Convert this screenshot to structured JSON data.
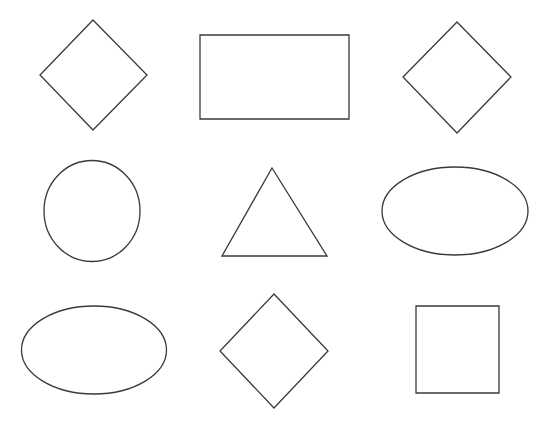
{
  "canvas": {
    "width": 551,
    "height": 426,
    "background_color": "#ffffff",
    "stroke_color": "#3a3a3a",
    "stroke_width": 1.3,
    "fill": "none",
    "title": "Geometric shapes grid"
  },
  "chart_data": {
    "type": "scatter",
    "xlabel": "",
    "ylabel": "",
    "xlim": [
      0,
      551
    ],
    "ylim": [
      0,
      426
    ],
    "grid": false,
    "legend": "none",
    "rows": 3,
    "columns": 3,
    "shape_count": 9,
    "shape_type_counts": {
      "diamond": 3,
      "ellipse": 2,
      "circle": 1,
      "rectangle": 1,
      "square": 1,
      "triangle": 1
    },
    "shapes": [
      {
        "index": 1,
        "name": "diamond",
        "row": 1,
        "column": 1,
        "center_x": 93,
        "center_y": 75,
        "width": 107,
        "height": 110,
        "points": "93,20 147,75 93,130 40,75"
      },
      {
        "index": 2,
        "name": "rectangle",
        "row": 1,
        "column": 2,
        "center_x": 274,
        "center_y": 77,
        "width": 149,
        "height": 84,
        "x": 200,
        "y": 35
      },
      {
        "index": 3,
        "name": "diamond",
        "row": 1,
        "column": 3,
        "center_x": 457,
        "center_y": 77,
        "width": 108,
        "height": 111,
        "points": "457,22 511,77 457,133 403,77"
      },
      {
        "index": 4,
        "name": "circle",
        "row": 2,
        "column": 1,
        "center_x": 92,
        "center_y": 211,
        "width": 96,
        "height": 101,
        "radius_x": 48,
        "radius_y": 50.5
      },
      {
        "index": 5,
        "name": "triangle",
        "row": 2,
        "column": 2,
        "center_x": 274,
        "center_y": 212,
        "width": 105,
        "height": 88,
        "points": "272,168 327,256 222,256"
      },
      {
        "index": 6,
        "name": "ellipse",
        "row": 2,
        "column": 3,
        "center_x": 455,
        "center_y": 211,
        "width": 146,
        "height": 88,
        "radius_x": 73,
        "radius_y": 44
      },
      {
        "index": 7,
        "name": "ellipse",
        "row": 3,
        "column": 1,
        "center_x": 94,
        "center_y": 350,
        "width": 145,
        "height": 88,
        "radius_x": 72.5,
        "radius_y": 44
      },
      {
        "index": 8,
        "name": "diamond",
        "row": 3,
        "column": 2,
        "center_x": 274,
        "center_y": 351,
        "width": 108,
        "height": 114,
        "points": "274,294 328,351 274,408 220,351"
      },
      {
        "index": 9,
        "name": "square",
        "row": 3,
        "column": 3,
        "center_x": 457,
        "center_y": 350,
        "width": 83,
        "height": 87,
        "x": 416,
        "y": 306
      }
    ]
  }
}
